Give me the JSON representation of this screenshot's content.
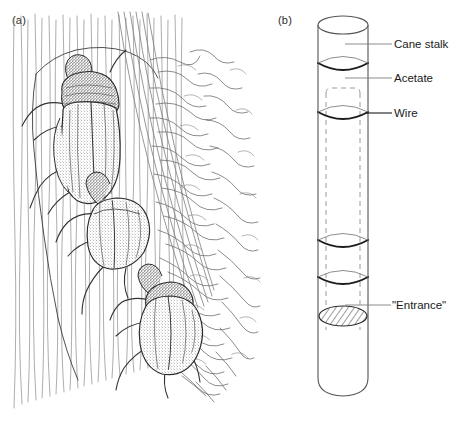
{
  "figure": {
    "type": "scientific-illustration",
    "background_color": "#ffffff",
    "ink_color": "#1a1a1a",
    "panels": [
      {
        "letter": "(a)",
        "description": "Pen-and-ink drawing of weevil beetles on a cane stalk with root tendrils"
      },
      {
        "letter": "(b)",
        "description": "Line diagram of a cane stalk cylinder with acetate sleeve, wire bands and an entrance hole"
      }
    ]
  },
  "panel_a": {
    "letter": "(a)"
  },
  "panel_b": {
    "letter": "(b)",
    "labels": {
      "cane_stalk": "Cane stalk",
      "acetate": "Acetate",
      "wire": "Wire",
      "entrance": "\"Entrance\""
    }
  }
}
